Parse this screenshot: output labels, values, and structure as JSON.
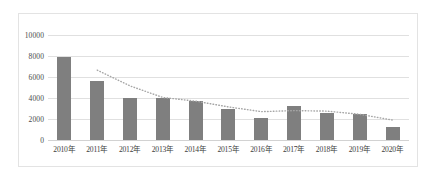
{
  "chart_data": {
    "type": "bar",
    "title": "",
    "subtitle": "",
    "xlabel": "",
    "ylabel": "",
    "categories": [
      "2010年",
      "2011年",
      "2012年",
      "2013年",
      "2014年",
      "2015年",
      "2016年",
      "2017年",
      "2018年",
      "2019年",
      "2020年"
    ],
    "values": [
      7900,
      5600,
      4000,
      4000,
      3700,
      2950,
      2050,
      3250,
      2550,
      2450,
      1200
    ],
    "series": [
      {
        "name": "bar-series",
        "type": "bar",
        "values": [
          7900,
          5600,
          4000,
          4000,
          3700,
          2950,
          2050,
          3250,
          2550,
          2450,
          1200
        ]
      },
      {
        "name": "trend-series",
        "type": "line",
        "style": "dotted",
        "values": [
          null,
          6650,
          5150,
          4050,
          3700,
          3150,
          2700,
          2800,
          2750,
          2450,
          1900
        ]
      }
    ],
    "ylim": [
      0,
      10000
    ],
    "yticks": [
      0,
      2000,
      4000,
      6000,
      8000,
      10000
    ],
    "ytick_labels": [
      "0",
      "2000",
      "4000",
      "6000",
      "8000",
      "10000"
    ],
    "grid": true,
    "legend": false,
    "legend_position": "none",
    "colors": {
      "bar": "#7f7f7f",
      "trend": "#a6a6a6",
      "gridline": "#e0e0e0",
      "frame": "#e3e3e3",
      "tick_text": "#4a4a4a",
      "background": "#ffffff"
    }
  }
}
